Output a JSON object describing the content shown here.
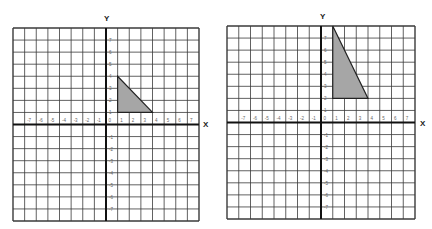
{
  "diagram": {
    "type": "coordinate-grid-transformation",
    "grids": [
      {
        "id": "left",
        "x_label": "X",
        "y_label": "Y",
        "x_range": [
          -8,
          8
        ],
        "y_range": [
          -8,
          8
        ],
        "x_ticks": [
          "-7",
          "-6",
          "-5",
          "-4",
          "-3",
          "-2",
          "-1",
          "0",
          "1",
          "2",
          "3",
          "4",
          "5",
          "6",
          "7"
        ],
        "y_ticks": [
          "7",
          "6",
          "5",
          "4",
          "3",
          "2",
          "1",
          "-1",
          "-2",
          "-3",
          "-4",
          "-5",
          "-6",
          "-7"
        ],
        "shape": {
          "name": "triangle",
          "vertices": [
            [
              1,
              4
            ],
            [
              1,
              1
            ],
            [
              4,
              1
            ]
          ],
          "fill": "#a6a6a6",
          "stroke": "#222222"
        }
      },
      {
        "id": "right",
        "x_label": "X",
        "y_label": "Y",
        "x_range": [
          -8,
          8
        ],
        "y_range": [
          -8,
          8
        ],
        "x_ticks": [
          "-7",
          "-6",
          "-5",
          "-4",
          "-3",
          "-2",
          "-1",
          "0",
          "1",
          "2",
          "3",
          "4",
          "5",
          "6",
          "7"
        ],
        "y_ticks": [
          "7",
          "6",
          "5",
          "4",
          "3",
          "2",
          "1",
          "-1",
          "-2",
          "-3",
          "-4",
          "-5",
          "-6",
          "-7"
        ],
        "shape": {
          "name": "triangle",
          "vertices": [
            [
              1,
              8
            ],
            [
              1,
              2
            ],
            [
              4,
              2
            ]
          ],
          "fill": "#a6a6a6",
          "stroke": "#222222"
        }
      }
    ]
  }
}
